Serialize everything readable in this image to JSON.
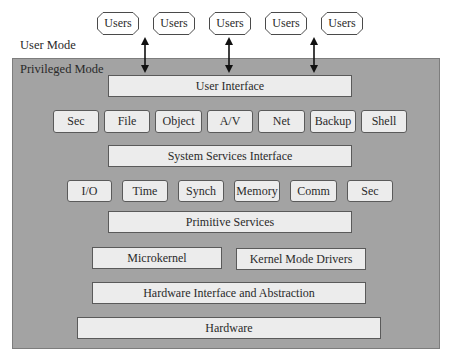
{
  "modes": {
    "user_mode": "User Mode",
    "privileged_mode": "Privileged Mode"
  },
  "users": [
    {
      "label": "Users"
    },
    {
      "label": "Users"
    },
    {
      "label": "Users"
    },
    {
      "label": "Users"
    },
    {
      "label": "Users"
    }
  ],
  "arrows": [
    {
      "from": "Users",
      "to": "User Interface",
      "direction": "bidirectional"
    },
    {
      "from": "Users",
      "to": "User Interface",
      "direction": "bidirectional"
    },
    {
      "from": "Users",
      "to": "User Interface",
      "direction": "bidirectional"
    }
  ],
  "layers": {
    "user_interface": "User Interface",
    "system_services": [
      "Sec",
      "File",
      "Object",
      "A/V",
      "Net",
      "Backup",
      "Shell"
    ],
    "system_services_interface": "System Services Interface",
    "primitives": [
      "I/O",
      "Time",
      "Synch",
      "Memory",
      "Comm",
      "Sec"
    ],
    "primitive_services": "Primitive Services",
    "microkernel": "Microkernel",
    "kernel_mode_drivers": "Kernel Mode Drivers",
    "hardware_interface": "Hardware Interface and Abstraction",
    "hardware": "Hardware"
  },
  "colors": {
    "privileged_bg": "#a3a3a3",
    "box_fill": "#ececec",
    "box_border": "#5a5a5a",
    "text": "#2a2a2a"
  }
}
